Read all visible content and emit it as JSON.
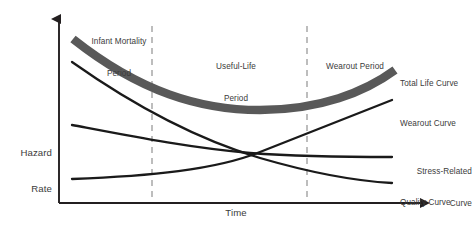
{
  "figure": {
    "background_color": "#ffffff",
    "axis_color": "#231f20",
    "curve_color": "#1a1a1a",
    "band_color": "#595959",
    "dashed_color": "#9a9a9a",
    "text_color": "#3b3b3b"
  },
  "axes": {
    "y_label_line1": "Hazard",
    "y_label_line2": "Rate",
    "x_label": "Time",
    "origin": {
      "x": 59,
      "y": 203
    },
    "y_arrow_tip": {
      "x": 59,
      "y": 10
    },
    "x_arrow_tip": {
      "x": 437,
      "y": 203
    }
  },
  "regions": [
    {
      "name": "infant-mortality",
      "label_line1": "Infant Mortality",
      "label_line2": "Period",
      "label_x": 119,
      "label_y": 17
    },
    {
      "name": "useful-life",
      "label_line1": "Useful-Life",
      "label_line2": "Period",
      "label_x": 236,
      "label_y": 41
    },
    {
      "name": "wearout",
      "label_line1": "Wearout Period",
      "label_line2": "",
      "label_x": 355,
      "label_y": 41
    }
  ],
  "dividers": [
    {
      "name": "infant-mortality-end",
      "x": 152,
      "y_top": 26,
      "y_bottom": 198
    },
    {
      "name": "useful-life-end",
      "x": 307,
      "y_top": 26,
      "y_bottom": 198
    }
  ],
  "curves": [
    {
      "name": "total-life-curve",
      "label_line1": "Total Life Curve",
      "label_line2": "",
      "label_x": 400,
      "label_y": 58,
      "style": "thick-gray-band",
      "path": "M 73,39 C 140,92 200,110 260,110 C 320,110 365,92 395,70"
    },
    {
      "name": "wearout-curve",
      "label_line1": "Wearout Curve",
      "label_line2": "",
      "label_x": 400,
      "label_y": 98,
      "style": "thin-black",
      "path": "M 72,179 C 150,176 215,170 260,152 C 310,132 355,115 392,100"
    },
    {
      "name": "stress-related-curve",
      "label_line1": "Stress-Related",
      "label_line2": "Curve",
      "label_x": 400,
      "label_y": 146,
      "style": "thin-black",
      "path": "M 72,125 C 130,136 190,148 250,153 C 305,157 350,157 392,157"
    },
    {
      "name": "quality-curve",
      "label_line1": "Quality Curve",
      "label_line2": "",
      "label_x": 400,
      "label_y": 177,
      "style": "thin-black",
      "path": "M 72,62 C 140,110 200,140 260,158 C 315,174 355,181 392,183"
    }
  ]
}
